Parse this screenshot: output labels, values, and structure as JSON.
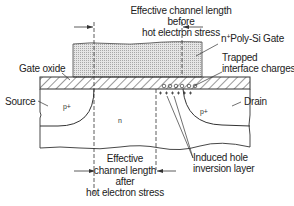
{
  "diagram": {
    "labels": {
      "top_length": [
        "Effective channel length",
        "before",
        "hot electron stress"
      ],
      "bottom_length": [
        "Effective",
        "channel length",
        "after",
        "hot electron stress"
      ],
      "gate": {
        "prefix": "n",
        "sup": "+",
        "suffix": "Poly-Si Gate"
      },
      "trapped": [
        "Trapped",
        "interface charges"
      ],
      "gate_oxide": "Gate oxide",
      "source": "Source",
      "drain": "Drain",
      "induced": [
        "Induced hole",
        "inversion layer"
      ],
      "source_region": "p+",
      "drain_region": "p+",
      "substrate": "n"
    },
    "colors": {
      "line": "#333333",
      "gate_fill": "#d9d9d9",
      "background": "#ffffff"
    }
  }
}
